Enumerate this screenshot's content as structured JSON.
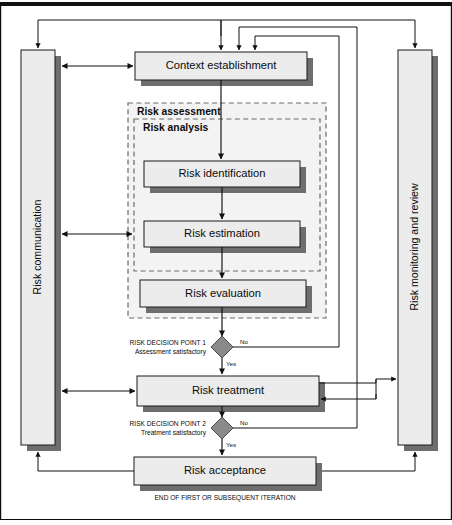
{
  "diagram": {
    "colors": {
      "box_fill": "#ececec",
      "box_border": "#1a1a1a",
      "box_shadow": "#6e6e6e",
      "group_fill": "#f3f3f3",
      "group_border": "#6a6a6a",
      "diamond_fill": "#8a8a8a",
      "connector": "#111111",
      "frame": "#0d0d0d",
      "page_background": "#ffffff"
    },
    "side_bars": [
      {
        "id": "risk-communication",
        "label": "Risk communication",
        "side": "left"
      },
      {
        "id": "risk-monitoring-and-review",
        "label": "Risk monitoring and review",
        "side": "right"
      }
    ],
    "groups": [
      {
        "id": "risk-assessment",
        "label": "Risk assessment"
      },
      {
        "id": "risk-analysis",
        "label": "Risk analysis"
      }
    ],
    "process_boxes": [
      {
        "id": "context-establishment",
        "label": "Context establishment"
      },
      {
        "id": "risk-identification",
        "label": "Risk identification"
      },
      {
        "id": "risk-estimation",
        "label": "Risk estimation"
      },
      {
        "id": "risk-evaluation",
        "label": "Risk evaluation"
      },
      {
        "id": "risk-treatment",
        "label": "Risk treatment"
      },
      {
        "id": "risk-acceptance",
        "label": "Risk acceptance"
      }
    ],
    "decision_points": [
      {
        "id": "risk-decision-point-1",
        "title": "RISK DECISION POINT 1",
        "subtitle": "Assessment satisfactory",
        "no_label": "No",
        "yes_label": "Yes"
      },
      {
        "id": "risk-decision-point-2",
        "title": "RISK DECISION POINT 2",
        "subtitle": "Treatment satisfactory",
        "no_label": "No",
        "yes_label": "Yes"
      }
    ],
    "footer_note": "END OF FIRST OR SUBSEQUENT ITERATION"
  }
}
